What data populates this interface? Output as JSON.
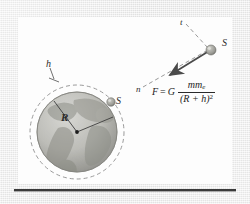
{
  "figure": {
    "panel_background": "#fdfdfd",
    "page_background": "#ececec",
    "rule_color": "#3a3a3a",
    "labels": {
      "altitude": "h",
      "radius": "R",
      "satellite_orbit": "S",
      "satellite_free": "S",
      "tangent": "t",
      "normal": "n"
    },
    "formula": {
      "force_symbol": "F",
      "equals": "=",
      "gravitational_constant": "G",
      "numerator_mass": "mm",
      "numerator_mass_subscript": "e",
      "denominator": "(R + h)",
      "denominator_exponent": "2",
      "plain_text": "F = G mm_e / (R + h)^2"
    },
    "earth": {
      "center_x": 77,
      "center_y": 132,
      "radius": 40,
      "orbit_radius": 47,
      "land_color": "#9fa09a",
      "ocean_color": "#c9c9c5",
      "orbit_stroke": "#9a9a9a"
    },
    "arrow": {
      "from_x": 210,
      "from_y": 52,
      "to_x": 166,
      "to_y": 78,
      "color": "#4a4a4a",
      "semantic": "gravitational-force-vector"
    }
  }
}
